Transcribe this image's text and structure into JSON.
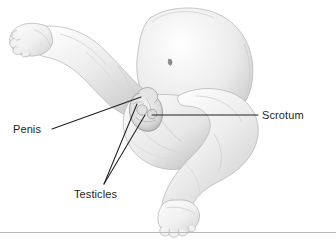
{
  "figure": {
    "style": "grayscale pencil medical illustration",
    "background_color": "#ffffff",
    "ink_color": "#231f20",
    "rule_color": "#b9b9b9",
    "width": 336,
    "height": 243
  },
  "callouts": [
    {
      "id": "penis",
      "label": "Penis",
      "text_x": 13,
      "text_y": 133,
      "anchor": "start",
      "leader": "M52,129 L141,97"
    },
    {
      "id": "scrotum",
      "label": "Scrotum",
      "text_x": 262,
      "text_y": 119,
      "anchor": "start",
      "leader": "M152,115 L258,115"
    },
    {
      "id": "testicles",
      "label": "Testicles",
      "text_x": 74,
      "text_y": 198,
      "anchor": "start",
      "leader": "M104,184 L137,104"
    },
    {
      "id": "testicles-second",
      "label": "",
      "text_x": 0,
      "text_y": 0,
      "anchor": "start",
      "leader": "M104,184 L145,115"
    }
  ],
  "anatomy_parts": [
    {
      "id": "torso",
      "name": "abdomen-and-torso"
    },
    {
      "id": "navel",
      "name": "navel"
    },
    {
      "id": "upper-leg",
      "name": "upper-left-leg"
    },
    {
      "id": "upper-foot",
      "name": "upper-left-foot"
    },
    {
      "id": "buttock",
      "name": "buttock"
    },
    {
      "id": "lower-leg",
      "name": "lower-right-leg"
    },
    {
      "id": "lower-foot",
      "name": "lower-right-foot"
    },
    {
      "id": "genitals",
      "name": "scrotum-and-penis"
    }
  ]
}
